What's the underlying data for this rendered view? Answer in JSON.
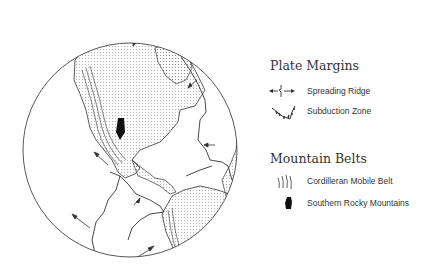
{
  "legend": {
    "plate_margins": {
      "heading": "Plate Margins",
      "items": [
        {
          "icon": "spreading-ridge-icon",
          "label": "Spreading Ridge"
        },
        {
          "icon": "subduction-zone-icon",
          "label": "Subduction Zone"
        }
      ]
    },
    "mountain_belts": {
      "heading": "Mountain Belts",
      "items": [
        {
          "icon": "cordilleran-belt-icon",
          "label": "Cordilleran Mobile Belt"
        },
        {
          "icon": "rocky-mountains-icon",
          "label": "Southern Rocky Mountains"
        }
      ]
    }
  },
  "map": {
    "subject": "Globe view of North and South America with plate boundaries",
    "colors": {
      "outline": "#333333",
      "land_dots": "#666666",
      "background": "#ffffff"
    }
  }
}
